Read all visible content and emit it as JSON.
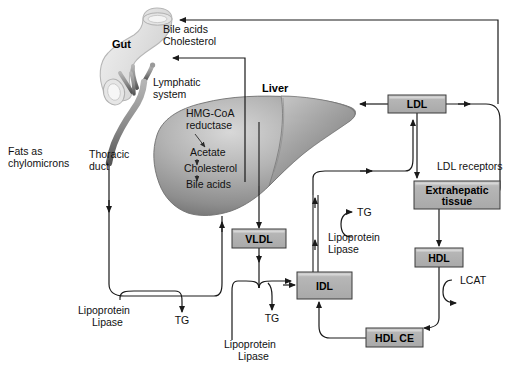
{
  "diagram": {
    "organs": [
      {
        "id": "gut",
        "label": "Gut"
      },
      {
        "id": "liver",
        "label": "Liver"
      }
    ],
    "boxes": [
      {
        "id": "ldl",
        "label": "LDL",
        "x": 388,
        "y": 95,
        "w": 58,
        "h": 18
      },
      {
        "id": "extrahepatic",
        "label": "Extrahepatic",
        "label2": "tissue",
        "x": 414,
        "y": 181,
        "w": 86,
        "h": 28
      },
      {
        "id": "vldl",
        "label": "VLDL",
        "x": 232,
        "y": 229,
        "w": 54,
        "h": 19
      },
      {
        "id": "hdl",
        "label": "HDL",
        "x": 415,
        "y": 248,
        "w": 48,
        "h": 19
      },
      {
        "id": "idl",
        "label": "IDL",
        "x": 297,
        "y": 272,
        "w": 55,
        "h": 27
      },
      {
        "id": "hdlce",
        "label": "HDL CE",
        "x": 366,
        "y": 328,
        "w": 57,
        "h": 19
      }
    ],
    "labels": [
      {
        "id": "bile-acids",
        "text": "Bile acids",
        "x": 163,
        "y": 33
      },
      {
        "id": "cholesterol-gut",
        "text": "Cholesterol",
        "x": 163,
        "y": 45
      },
      {
        "id": "lymphatic",
        "text": "Lymphatic",
        "x": 153,
        "y": 86
      },
      {
        "id": "lymphatic-2",
        "text": "system",
        "x": 153,
        "y": 98
      },
      {
        "id": "hmg-coa",
        "text": "HMG-CoA",
        "x": 186,
        "y": 117
      },
      {
        "id": "reductase",
        "text": "reductase",
        "x": 186,
        "y": 129
      },
      {
        "id": "acetate",
        "text": "Acetate",
        "x": 190,
        "y": 156
      },
      {
        "id": "cholesterol-liver",
        "text": "Cholesterol",
        "x": 184,
        "y": 172
      },
      {
        "id": "bile-acids-liver",
        "text": "Bile acids",
        "x": 186,
        "y": 188
      },
      {
        "id": "thoracic",
        "text": "Thoracic",
        "x": 89,
        "y": 158
      },
      {
        "id": "duct",
        "text": "duct",
        "x": 89,
        "y": 170
      },
      {
        "id": "fats-as",
        "text": "Fats as",
        "x": 8,
        "y": 155
      },
      {
        "id": "chylomicrons",
        "text": "chylomicrons",
        "x": 8,
        "y": 167
      },
      {
        "id": "ldl-receptors",
        "text": "LDL receptors",
        "x": 437,
        "y": 170
      },
      {
        "id": "tg-mid",
        "text": "TG",
        "x": 357,
        "y": 208
      },
      {
        "id": "lipoprotein-mid",
        "text": "Lipoprotein",
        "x": 328,
        "y": 233
      },
      {
        "id": "lipase-mid",
        "text": "Lipase",
        "x": 328,
        "y": 245
      },
      {
        "id": "lcat",
        "text": "LCAT",
        "x": 460,
        "y": 284
      },
      {
        "id": "lipoprotein-left",
        "text": "Lipoprotein",
        "x": 78,
        "y": 306
      },
      {
        "id": "lipase-left",
        "text": "Lipase",
        "x": 92,
        "y": 318
      },
      {
        "id": "tg-left",
        "text": "TG",
        "x": 189,
        "y": 306
      },
      {
        "id": "lipoprotein-low",
        "text": "Lipoprotein",
        "x": 224,
        "y": 340
      },
      {
        "id": "lipase-low",
        "text": "Lipase",
        "x": 238,
        "y": 352
      },
      {
        "id": "tg-low",
        "text": "TG",
        "x": 272,
        "y": 321
      }
    ],
    "colors": {
      "box_fill": "#b3b3b3",
      "box_stroke": "#3a3a3a",
      "box_highlight": "#d4d4d4",
      "liver_light": "#cfcfcf",
      "liver_mid": "#9a9a9a",
      "liver_dark": "#6e6e6e",
      "gut_fill": "#e8e8e8",
      "gut_stroke": "#b0b0b0",
      "duct_dark": "#5c5c5c",
      "duct_light": "#a8a8a8",
      "line": "#1a1a1a",
      "text": "#111111",
      "background": "#ffffff"
    }
  }
}
